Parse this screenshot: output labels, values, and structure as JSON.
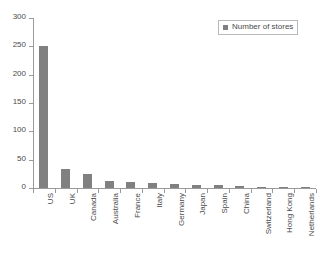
{
  "chart_data": {
    "type": "bar",
    "title": "",
    "xlabel": "",
    "ylabel": "",
    "ylim": [
      0,
      300
    ],
    "yticks": [
      0,
      50,
      100,
      150,
      200,
      250,
      300
    ],
    "grid": false,
    "legend_position": "top-right",
    "series": [
      {
        "name": "Number of stores",
        "color": "#808080",
        "values": [
          250,
          33,
          25,
          13,
          11,
          9,
          7,
          6,
          6,
          4,
          2,
          1,
          1
        ]
      }
    ],
    "categories": [
      "US",
      "UK",
      "Canada",
      "Australia",
      "France",
      "Italy",
      "Germany",
      "Japan",
      "Spain",
      "China",
      "Switzerland",
      "Hong Kong",
      "Netherlands"
    ]
  },
  "legend": {
    "entries": [
      {
        "label": "Number of stores",
        "color": "#808080"
      }
    ]
  },
  "colors": {
    "bar": "#808080",
    "axis": "#9a9a9a",
    "text": "#4a4a4a",
    "background": "#ffffff",
    "legend_border": "#b9b9b9"
  }
}
